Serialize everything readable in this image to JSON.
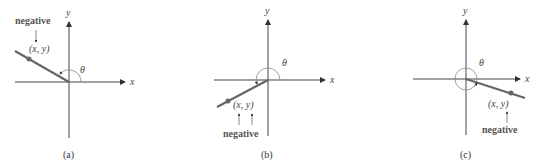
{
  "panels": [
    {
      "id": "a",
      "caption": "(a)",
      "point_label": "(x, y)",
      "note": "negative",
      "axis_x": "x",
      "axis_y": "y",
      "angle": "θ"
    },
    {
      "id": "b",
      "caption": "(b)",
      "point_label": "(x, y)",
      "note": "negative",
      "axis_x": "x",
      "axis_y": "y",
      "angle": "θ"
    },
    {
      "id": "c",
      "caption": "(c)",
      "point_label": "(x, y)",
      "note": "negative",
      "axis_x": "x",
      "axis_y": "y",
      "angle": "θ"
    }
  ],
  "colors": {
    "axis": "#444444",
    "ray": "#666666",
    "arc": "#888888"
  }
}
